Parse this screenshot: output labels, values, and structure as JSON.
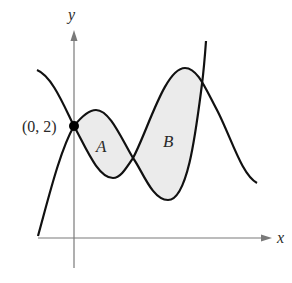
{
  "figure": {
    "axes": {
      "x_label": "x",
      "y_label": "y",
      "axis_color": "#7a7a7a"
    },
    "point": {
      "label": "(0, 2)",
      "x": 0,
      "y": 2
    },
    "regions": [
      {
        "label": "A",
        "fill": "#ebebeb"
      },
      {
        "label": "B",
        "fill": "#ebebeb"
      }
    ],
    "curve_color": "#111111"
  }
}
